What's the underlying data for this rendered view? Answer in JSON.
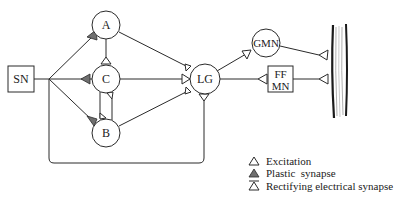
{
  "diagram": {
    "nodes": {
      "sn": {
        "label": "SN",
        "shape": "box"
      },
      "a": {
        "label": "A",
        "shape": "circle"
      },
      "c": {
        "label": "C",
        "shape": "circle"
      },
      "b": {
        "label": "B",
        "shape": "circle"
      },
      "lg": {
        "label": "LG",
        "shape": "circle"
      },
      "gmn": {
        "label": "GMN",
        "shape": "circle"
      },
      "ffmn": {
        "label_line1": "FF",
        "label_line2": "MN",
        "shape": "box"
      },
      "muscle": {
        "label": "",
        "shape": "muscle-fiber"
      }
    },
    "connections": [
      {
        "from": "SN",
        "to": "A",
        "synapse": "plastic"
      },
      {
        "from": "SN",
        "to": "C",
        "synapse": "plastic"
      },
      {
        "from": "SN",
        "to": "B",
        "synapse": "plastic"
      },
      {
        "from": "SN",
        "to": "LG",
        "synapse": "rectifying-electrical"
      },
      {
        "from": "A",
        "to": "C",
        "synapse": "rectifying-electrical"
      },
      {
        "from": "B",
        "to": "C",
        "synapse": "rectifying-electrical"
      },
      {
        "from": "C",
        "to": "B",
        "synapse": "rectifying-electrical"
      },
      {
        "from": "A",
        "to": "LG",
        "synapse": "rectifying-electrical"
      },
      {
        "from": "C",
        "to": "LG",
        "synapse": "rectifying-electrical"
      },
      {
        "from": "B",
        "to": "LG",
        "synapse": "rectifying-electrical"
      },
      {
        "from": "LG",
        "to": "GMN",
        "synapse": "excitation"
      },
      {
        "from": "LG",
        "to": "FF MN",
        "synapse": "excitation"
      },
      {
        "from": "GMN",
        "to": "Muscle",
        "synapse": "excitation"
      },
      {
        "from": "FF MN",
        "to": "Muscle",
        "synapse": "excitation"
      }
    ],
    "colors": {
      "line": "#2a2a2a",
      "plastic_fill": "#6f6f6f",
      "background": "#ffffff"
    }
  },
  "legend": {
    "items": [
      {
        "icon": "open-triangle-icon",
        "label": "Excitation"
      },
      {
        "icon": "filled-triangle-icon",
        "label": "Plastic  synapse"
      },
      {
        "icon": "barred-triangle-icon",
        "label": "Rectifying electrical synapse"
      }
    ]
  }
}
